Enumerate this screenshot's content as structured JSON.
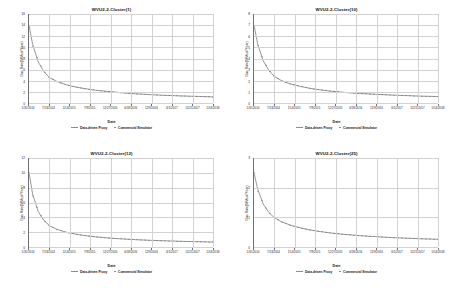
{
  "figure": {
    "background": "#ffffff",
    "line_color": "#8d8d8d",
    "marker_color": "#7a7a7a",
    "grid_color": "#d2d2d2",
    "axis_color": "#6f6f6f"
  },
  "legend": {
    "proxy_label": "Data-driven Proxy",
    "simulator_label": "Commercial Simulator"
  },
  "axis": {
    "xlabel": "Date",
    "ylabel": "Gas Rate(MMscf/Year)"
  },
  "chart_data": [
    {
      "type": "line",
      "title": "WVU2-2-Cluster(1)",
      "xlabel": "Date",
      "ylabel": "Gas Rate(MMscf/Year)",
      "grid": true,
      "legend_position": "bottom",
      "ylim": [
        0,
        16
      ],
      "yticks": [
        0,
        2,
        4,
        6,
        8,
        10,
        12,
        14,
        16
      ],
      "xticks": [
        "1/31/2014",
        "7/24/2014",
        "1/14/2015",
        "7/9/2015",
        "12/27/2015",
        "6/18/2016",
        "12/9/2016",
        "6/1/2017",
        "11/21/2017",
        "5/14/2018"
      ],
      "x": [
        0,
        0.02,
        0.05,
        0.08,
        0.11,
        0.15,
        0.2,
        0.25,
        0.3,
        0.36,
        0.42,
        0.5,
        0.58,
        0.66,
        0.74,
        0.82,
        0.9,
        1.0
      ],
      "series": [
        {
          "name": "Data-driven Proxy",
          "values": [
            14.0,
            10.5,
            7.4,
            5.7,
            4.6,
            3.9,
            3.3,
            2.9,
            2.6,
            2.3,
            2.1,
            1.85,
            1.65,
            1.5,
            1.38,
            1.28,
            1.2,
            1.1
          ]
        },
        {
          "name": "Commercial Simulator",
          "values": [
            14.0,
            10.4,
            7.5,
            5.8,
            4.6,
            3.85,
            3.3,
            2.9,
            2.6,
            2.3,
            2.1,
            1.85,
            1.65,
            1.5,
            1.38,
            1.28,
            1.2,
            1.1
          ]
        }
      ]
    },
    {
      "type": "line",
      "title": "WVU2-2-Cluster(10)",
      "xlabel": "Date",
      "ylabel": "Gas Rate(MMscf/Year)",
      "grid": true,
      "legend_position": "bottom",
      "ylim": [
        0,
        8
      ],
      "yticks": [
        0,
        1,
        2,
        3,
        4,
        5,
        6,
        7,
        8
      ],
      "xticks": [
        "1/31/2014",
        "7/24/2014",
        "1/14/2015",
        "7/9/2015",
        "12/27/2015",
        "6/18/2016",
        "12/9/2016",
        "6/1/2017",
        "11/21/2017",
        "5/14/2018"
      ],
      "x": [
        0,
        0.02,
        0.05,
        0.08,
        0.11,
        0.15,
        0.2,
        0.25,
        0.3,
        0.36,
        0.42,
        0.5,
        0.58,
        0.66,
        0.74,
        0.82,
        0.9,
        1.0
      ],
      "series": [
        {
          "name": "Data-driven Proxy",
          "values": [
            7.0,
            5.3,
            3.8,
            2.95,
            2.4,
            2.0,
            1.7,
            1.5,
            1.33,
            1.18,
            1.06,
            0.94,
            0.85,
            0.78,
            0.72,
            0.67,
            0.62,
            0.58
          ]
        },
        {
          "name": "Commercial Simulator",
          "values": [
            7.0,
            5.25,
            3.85,
            2.95,
            2.4,
            2.0,
            1.7,
            1.5,
            1.33,
            1.18,
            1.06,
            0.94,
            0.85,
            0.78,
            0.72,
            0.67,
            0.62,
            0.58
          ]
        }
      ]
    },
    {
      "type": "line",
      "title": "WVU2-2-Cluster(12)",
      "xlabel": "Date",
      "ylabel": "Gas Rate(MMscf/Year)",
      "grid": true,
      "legend_position": "bottom",
      "ylim": [
        0,
        12
      ],
      "yticks": [
        0,
        2,
        4,
        6,
        8,
        10,
        12
      ],
      "xticks": [
        "1/31/2014",
        "7/24/2014",
        "1/14/2015",
        "7/9/2015",
        "12/27/2015",
        "6/18/2016",
        "12/9/2016",
        "6/1/2017",
        "11/21/2017",
        "5/14/2018"
      ],
      "x": [
        0,
        0.02,
        0.05,
        0.08,
        0.11,
        0.15,
        0.2,
        0.25,
        0.3,
        0.36,
        0.42,
        0.5,
        0.58,
        0.66,
        0.74,
        0.82,
        0.9,
        1.0
      ],
      "series": [
        {
          "name": "Data-driven Proxy",
          "values": [
            10.0,
            7.1,
            4.8,
            3.6,
            2.9,
            2.4,
            2.0,
            1.75,
            1.55,
            1.38,
            1.24,
            1.1,
            0.99,
            0.9,
            0.83,
            0.77,
            0.72,
            0.67
          ]
        },
        {
          "name": "Commercial Simulator",
          "values": [
            10.0,
            7.0,
            4.85,
            3.6,
            2.9,
            2.4,
            2.0,
            1.75,
            1.55,
            1.38,
            1.24,
            1.1,
            0.99,
            0.9,
            0.83,
            0.77,
            0.72,
            0.67
          ]
        }
      ]
    },
    {
      "type": "line",
      "title": "WVU2-2-Cluster(25)",
      "xlabel": "Date",
      "ylabel": "Gas Rate(MMscf/Year)",
      "grid": true,
      "legend_position": "bottom",
      "ylim": [
        0,
        3
      ],
      "yticks": [
        0,
        1,
        2,
        3
      ],
      "xticks": [
        "1/31/2014",
        "7/24/2014",
        "1/14/2015",
        "7/9/2015",
        "12/27/2015",
        "6/18/2016",
        "12/9/2016",
        "6/1/2017",
        "11/21/2017",
        "5/14/2018"
      ],
      "x": [
        0,
        0.02,
        0.05,
        0.08,
        0.11,
        0.15,
        0.2,
        0.25,
        0.3,
        0.36,
        0.42,
        0.5,
        0.58,
        0.66,
        0.74,
        0.82,
        0.9,
        1.0
      ],
      "series": [
        {
          "name": "Data-driven Proxy",
          "values": [
            2.5,
            1.95,
            1.45,
            1.17,
            0.99,
            0.85,
            0.73,
            0.65,
            0.58,
            0.52,
            0.47,
            0.42,
            0.38,
            0.35,
            0.32,
            0.3,
            0.28,
            0.26
          ]
        },
        {
          "name": "Commercial Simulator",
          "values": [
            2.5,
            1.9,
            1.47,
            1.17,
            0.99,
            0.85,
            0.73,
            0.65,
            0.58,
            0.52,
            0.47,
            0.42,
            0.38,
            0.35,
            0.32,
            0.3,
            0.28,
            0.26
          ]
        }
      ]
    }
  ]
}
